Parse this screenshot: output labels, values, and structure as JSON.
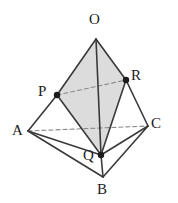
{
  "figure": {
    "name": "tetrahedron-cross-section",
    "type": "3d-solid-diagram",
    "canvas": {
      "width": 178,
      "height": 203
    },
    "background_color": "#ffffff"
  },
  "style": {
    "solid_edge_color": "#3a3a3a",
    "hidden_edge_color": "#8a8a8a",
    "shaded_face_fill": "#dcdcdc",
    "shaded_face_stroke": "#555555",
    "point_marker_color": "#1b1b1b",
    "label_color": "#1b1b1b",
    "solid_edge_width": 1.6,
    "hidden_edge_width": 1.1,
    "hidden_edge_dash": "4,3"
  },
  "points": [
    {
      "id": "O",
      "label": "O",
      "x": 96,
      "y": 39,
      "marker": false,
      "label_x": 89,
      "label_y": 12
    },
    {
      "id": "A",
      "label": "A",
      "x": 28,
      "y": 131,
      "marker": false,
      "label_x": 12,
      "label_y": 123
    },
    {
      "id": "B",
      "label": "B",
      "x": 103,
      "y": 177,
      "marker": false,
      "label_x": 97,
      "label_y": 182
    },
    {
      "id": "C",
      "label": "C",
      "x": 148,
      "y": 126,
      "marker": false,
      "label_x": 151,
      "label_y": 116
    },
    {
      "id": "P",
      "label": "P",
      "x": 57,
      "y": 95,
      "marker": true,
      "label_x": 38,
      "label_y": 84
    },
    {
      "id": "Q",
      "label": "Q",
      "x": 101,
      "y": 155,
      "marker": true,
      "label_x": 83,
      "label_y": 148
    },
    {
      "id": "R",
      "label": "R",
      "x": 126,
      "y": 80,
      "marker": true,
      "label_x": 131,
      "label_y": 68
    }
  ],
  "shaded_face": {
    "name": "cross-section-OPQR",
    "vertices": [
      "O",
      "P",
      "Q",
      "R"
    ],
    "polygon_points": "96,39 57,95 101,155 126,80",
    "fill": "#dcdcdc"
  },
  "edges": [
    {
      "id": "OA",
      "from": "O",
      "to": "A",
      "hidden": false,
      "segment": "P-A",
      "x1": 57,
      "y1": 95,
      "x2": 28,
      "y2": 131
    },
    {
      "id": "OC",
      "from": "O",
      "to": "C",
      "hidden": false,
      "segment": "R-C",
      "x1": 126,
      "y1": 80,
      "x2": 148,
      "y2": 126
    },
    {
      "id": "OB",
      "from": "O",
      "to": "B",
      "hidden": false,
      "segment": "Q-B",
      "x1": 101,
      "y1": 155,
      "x2": 103,
      "y2": 177
    },
    {
      "id": "OP",
      "from": "O",
      "to": "P",
      "hidden": false,
      "x1": 96,
      "y1": 39,
      "x2": 57,
      "y2": 95
    },
    {
      "id": "OR",
      "from": "O",
      "to": "R",
      "hidden": false,
      "x1": 96,
      "y1": 39,
      "x2": 126,
      "y2": 80
    },
    {
      "id": "OQ",
      "from": "O",
      "to": "Q",
      "hidden": false,
      "x1": 96,
      "y1": 39,
      "x2": 101,
      "y2": 155
    },
    {
      "id": "PQ",
      "from": "P",
      "to": "Q",
      "hidden": false,
      "x1": 57,
      "y1": 95,
      "x2": 101,
      "y2": 155
    },
    {
      "id": "RQ",
      "from": "R",
      "to": "Q",
      "hidden": false,
      "x1": 126,
      "y1": 80,
      "x2": 101,
      "y2": 155
    },
    {
      "id": "AB",
      "from": "A",
      "to": "B",
      "hidden": false,
      "x1": 28,
      "y1": 131,
      "x2": 103,
      "y2": 177
    },
    {
      "id": "BC",
      "from": "B",
      "to": "C",
      "hidden": false,
      "x1": 103,
      "y1": 177,
      "x2": 148,
      "y2": 126
    },
    {
      "id": "AQ",
      "from": "A",
      "to": "Q",
      "hidden": false,
      "x1": 28,
      "y1": 131,
      "x2": 101,
      "y2": 155
    },
    {
      "id": "QC",
      "from": "Q",
      "to": "C",
      "hidden": false,
      "x1": 101,
      "y1": 155,
      "x2": 148,
      "y2": 126
    }
  ],
  "hidden_edges": [
    {
      "id": "PR",
      "from": "P",
      "to": "R",
      "x1": 57,
      "y1": 95,
      "x2": 126,
      "y2": 80
    },
    {
      "id": "AC",
      "from": "A",
      "to": "C",
      "x1": 28,
      "y1": 131,
      "x2": 148,
      "y2": 126
    }
  ]
}
